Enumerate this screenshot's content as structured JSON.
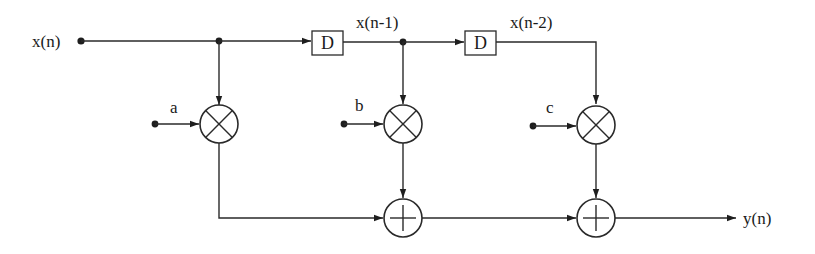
{
  "diagram": {
    "type": "FIR filter signal-flow diagram",
    "input_label": "x(n)",
    "output_label": "y(n)",
    "delay_blocks": [
      {
        "label": "D",
        "output_label": "x(n-1)"
      },
      {
        "label": "D",
        "output_label": "x(n-2)"
      }
    ],
    "coefficients": [
      {
        "label": "a",
        "multiplies": "x(n)"
      },
      {
        "label": "b",
        "multiplies": "x(n-1)"
      },
      {
        "label": "c",
        "multiplies": "x(n-2)"
      }
    ],
    "multiplier_symbol": "×",
    "adder_symbol": "+",
    "adders": [
      {
        "inputs": [
          "a·x(n)",
          "b·x(n-1)"
        ]
      },
      {
        "inputs": [
          "adder-1 output",
          "c·x(n-2)"
        ]
      }
    ],
    "equation": "y(n) = a·x(n) + b·x(n-1) + c·x(n-2)",
    "colors": {
      "ink": "#1e1e1e",
      "background": "#ffffff"
    }
  }
}
